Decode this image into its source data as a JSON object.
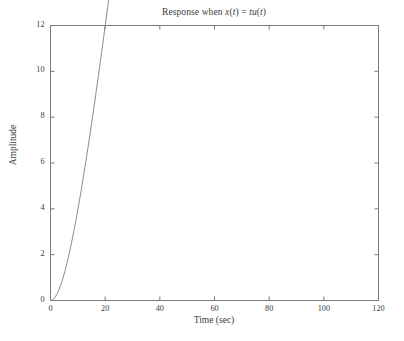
{
  "chart_data": {
    "type": "line",
    "title": "Response when x(t) = tu(t)",
    "title_parts": {
      "prefix": "Response when ",
      "var1": "x",
      "paren1_open": "(",
      "t1": "t",
      "paren1_close": ")",
      "equals": " = ",
      "t2": "t",
      "u": "u",
      "paren2_open": "(",
      "t3": "t",
      "paren2_close": ")"
    },
    "xlabel": "Time (sec)",
    "ylabel": "Amplitude",
    "xlim": [
      0,
      120
    ],
    "ylim": [
      0,
      12
    ],
    "xticks": [
      0,
      20,
      40,
      60,
      80,
      100,
      120
    ],
    "yticks": [
      0,
      2,
      4,
      6,
      8,
      10,
      12
    ],
    "xtick_labels": [
      "0",
      "20",
      "40",
      "60",
      "80",
      "100",
      "120"
    ],
    "ytick_labels": [
      "0",
      "2",
      "4",
      "6",
      "8",
      "10",
      "12"
    ],
    "grid": false,
    "legend": null,
    "line_color": "#8a8a8a",
    "axis_color": "#7a7a7a",
    "background_color": "#ffffff",
    "series": [
      {
        "name": "ramp response",
        "description": "y(t) = t - tau*(1 - exp(-t/tau)), tau = 9",
        "x": [
          0,
          2,
          4,
          6,
          8,
          10,
          12,
          14,
          16,
          18,
          20,
          25,
          30,
          35,
          40,
          45,
          50,
          55,
          60,
          65,
          70,
          75,
          80,
          85,
          90,
          95,
          100,
          105,
          110
        ],
        "y": [
          0.0,
          0.2,
          0.74,
          1.52,
          2.45,
          3.04,
          3.79,
          4.62,
          5.51,
          6.44,
          7.4,
          9.89,
          12.44,
          15.02,
          17.62,
          20.23,
          22.84,
          25.46,
          28.08,
          30.7,
          33.33,
          35.95,
          38.58,
          41.2,
          43.83,
          46.45,
          49.08,
          51.7,
          54.33
        ]
      }
    ],
    "plotted_points": {
      "note": "rendered curve values matching the visible axes (0-12 amplitude)",
      "x": [
        0,
        2,
        4,
        6,
        8,
        10,
        12,
        14,
        16,
        18,
        20,
        25,
        30,
        35,
        40,
        45,
        50,
        55,
        60,
        65,
        70,
        75,
        80,
        85,
        90,
        95,
        100,
        105,
        110
      ],
      "y": [
        0.0,
        0.19,
        0.68,
        1.37,
        2.18,
        2.05,
        2.75,
        3.48,
        4.25,
        5.05,
        5.87,
        7.98,
        10.13,
        12.3,
        14.48,
        16.66,
        18.85,
        21.04,
        23.23,
        25.42,
        27.61,
        29.8,
        32.0,
        34.19,
        36.38,
        38.58,
        40.77,
        42.96,
        45.15
      ]
    },
    "curve_endpoint": {
      "x": 110,
      "y": 10.8
    },
    "tau": 9
  }
}
